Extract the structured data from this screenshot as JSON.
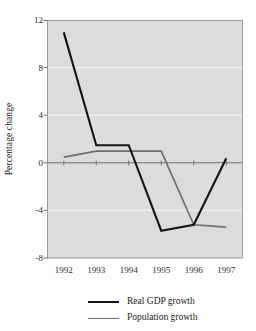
{
  "chart_data": {
    "type": "line",
    "title": "",
    "xlabel": "",
    "ylabel": "Percentage change",
    "categories": [
      "1992",
      "1993",
      "1994",
      "1995",
      "1996",
      "1997"
    ],
    "x": [
      1992,
      1993,
      1994,
      1995,
      1996,
      1997
    ],
    "ylim": [
      -8,
      12
    ],
    "yticks": [
      12,
      8,
      4,
      0,
      -4,
      -8
    ],
    "ytick_labels": [
      "12",
      "8",
      "4",
      "0",
      "-4",
      "-8"
    ],
    "grid": true,
    "grid_axis": "y",
    "legend_position": "bottom",
    "plot_background": "#dcdcdc",
    "gridline_color": "#f2f2f2",
    "zeroline_color": "#707070",
    "frame_color": "#9a9a9a",
    "series": [
      {
        "name": "Real GDP growth",
        "color": "#141414",
        "values": [
          11.0,
          1.5,
          1.5,
          -5.7,
          -5.2,
          0.4
        ]
      },
      {
        "name": "Population growth",
        "color": "#6f6f6f",
        "values": [
          0.5,
          1.0,
          1.0,
          1.0,
          -5.2,
          -5.4
        ]
      }
    ]
  },
  "legend": {
    "items": [
      {
        "label": "Real GDP growth"
      },
      {
        "label": "Population growth"
      }
    ]
  },
  "axes": {
    "y_title": "Percentage change"
  }
}
